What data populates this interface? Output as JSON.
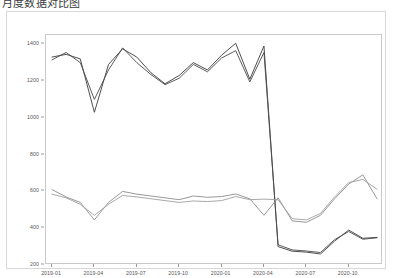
{
  "title": "月度数据对比图",
  "chart_data": {
    "type": "line",
    "title": "",
    "xlabel": "",
    "ylabel": "",
    "ylim": [
      200,
      1450
    ],
    "yticks": [
      200,
      400,
      600,
      800,
      1000,
      1200,
      1400
    ],
    "ytick_labels": [
      "200",
      "400",
      "600",
      "800",
      "1000",
      "1200",
      "1400"
    ],
    "xtick_labels": [
      "2019-01",
      "2019-04",
      "2019-07",
      "2019-10",
      "2020-01",
      "2020-04",
      "2020-07",
      "2020-10"
    ],
    "xtick_index": [
      0,
      3,
      6,
      9,
      12,
      15,
      18,
      21
    ],
    "grid": false,
    "legend": "none",
    "x": [
      "2018-12",
      "2019-01",
      "2019-02",
      "2019-03",
      "2019-04",
      "2019-05",
      "2019-06",
      "2019-07",
      "2019-08",
      "2019-09",
      "2019-10",
      "2019-11",
      "2019-12",
      "2020-01",
      "2020-02",
      "2020-03",
      "2020-04",
      "2020-05",
      "2020-06",
      "2020-07",
      "2020-08",
      "2020-09",
      "2020-10",
      "2020-11"
    ],
    "series": [
      {
        "name": "series-upper-a",
        "color": "#3a3a3a",
        "values": [
          1330,
          1345,
          1320,
          1030,
          1290,
          1375,
          1330,
          1245,
          1185,
          1230,
          1300,
          1260,
          1340,
          1405,
          1210,
          1390,
          300,
          275,
          270,
          260,
          330,
          390,
          345,
          350
        ]
      },
      {
        "name": "series-upper-b",
        "color": "#4a4a4a",
        "values": [
          1315,
          1355,
          1300,
          1100,
          1260,
          1380,
          1300,
          1235,
          1180,
          1215,
          1290,
          1250,
          1325,
          1365,
          1195,
          1355,
          310,
          282,
          276,
          268,
          338,
          382,
          340,
          348
        ]
      },
      {
        "name": "series-lower-a",
        "color": "#8c8c8c",
        "values": [
          610,
          570,
          540,
          445,
          540,
          600,
          585,
          575,
          565,
          555,
          575,
          568,
          572,
          586,
          560,
          470,
          565,
          440,
          432,
          470,
          560,
          640,
          690,
          560
        ]
      },
      {
        "name": "series-lower-b",
        "color": "#9e9e9e",
        "values": [
          585,
          565,
          530,
          470,
          530,
          578,
          570,
          560,
          550,
          540,
          548,
          545,
          550,
          572,
          555,
          558,
          555,
          452,
          445,
          480,
          570,
          648,
          665,
          612
        ]
      }
    ]
  }
}
